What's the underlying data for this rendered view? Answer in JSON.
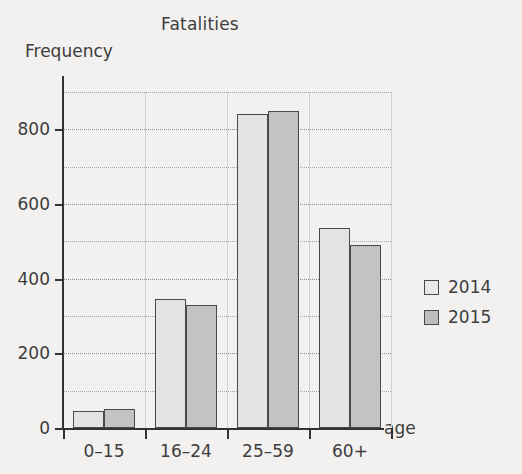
{
  "chart_data": {
    "type": "bar",
    "title": "Fatalities",
    "xlabel": "age",
    "ylabel": "Frequency",
    "categories": [
      "0–15",
      "16–24",
      "25–59",
      "60+"
    ],
    "series": [
      {
        "name": "2014",
        "values": [
          45,
          345,
          840,
          535
        ],
        "color": "#e3e3e3"
      },
      {
        "name": "2015",
        "values": [
          50,
          330,
          850,
          490
        ],
        "color": "#c3c3c3"
      }
    ],
    "ylim": [
      0,
      900
    ],
    "yticks": [
      0,
      200,
      400,
      600,
      800
    ],
    "ytick_labels": [
      "0",
      "200",
      "400",
      "600",
      "800"
    ],
    "minor_tick_step": 100,
    "grid": "horizontal-dotted-and-vertical-solid",
    "legend_position": "right"
  },
  "legend": {
    "entries": [
      {
        "label": "2014"
      },
      {
        "label": "2015"
      }
    ]
  }
}
